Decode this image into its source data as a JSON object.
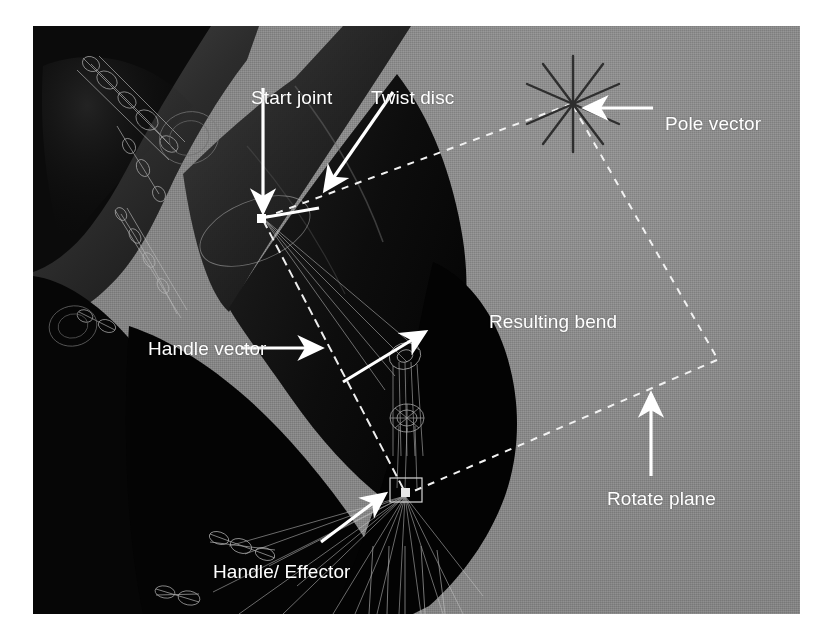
{
  "figure": {
    "kind": "3d-viewport-screenshot",
    "viewport": {
      "background_color": "#8c8c8c",
      "model_color": "#1a1a1a",
      "wireframe_color": "#9a9a9a",
      "annotation_color": "#ffffff",
      "locator_color": "#3a3a3a",
      "guide_style": "dashed"
    },
    "annotations": [
      {
        "id": "start-joint",
        "label": "Start joint",
        "arrow": "down",
        "target": "shoulder joint at top of IK chain"
      },
      {
        "id": "twist-disc",
        "label": "Twist disc",
        "arrow": "down-left",
        "target": "twist disc manipulator"
      },
      {
        "id": "pole-vector",
        "label": "Pole vector",
        "arrow": "left",
        "target": "pole vector locator star"
      },
      {
        "id": "resulting-bend",
        "label": "Resulting bend",
        "arrow": "up-right",
        "target": "elbow bend direction"
      },
      {
        "id": "handle-vector",
        "label": "Handle vector",
        "arrow": "right",
        "target": "handle vector line"
      },
      {
        "id": "rotate-plane",
        "label": "Rotate plane",
        "arrow": "up",
        "target": "dashed rotate plane boundary"
      },
      {
        "id": "handle-effector",
        "label": "Handle/ Effector",
        "arrow": "up-right",
        "target": "IK handle and effector at wrist"
      }
    ]
  }
}
